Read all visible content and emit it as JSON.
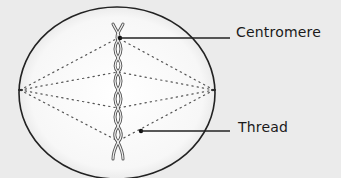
{
  "diagram": {
    "labels": {
      "centromere": "Centromere",
      "thread": "Thread"
    },
    "colors": {
      "background": "#ebebeb",
      "cell_fill": "#fafafa",
      "outline": "#222222",
      "thread": "#555555"
    }
  }
}
